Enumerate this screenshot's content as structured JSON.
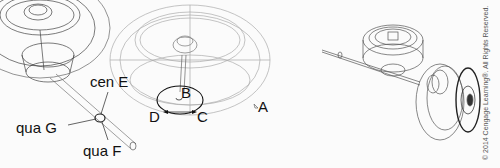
{
  "figure": {
    "labels": {
      "cen_e": "cen E",
      "qua_g": "qua G",
      "qua_f": "qua F",
      "b": "B",
      "c": "C",
      "d": "D",
      "a": "A"
    },
    "copyright": "© 2014 Cengage Learning®. All Rights Reserved."
  }
}
